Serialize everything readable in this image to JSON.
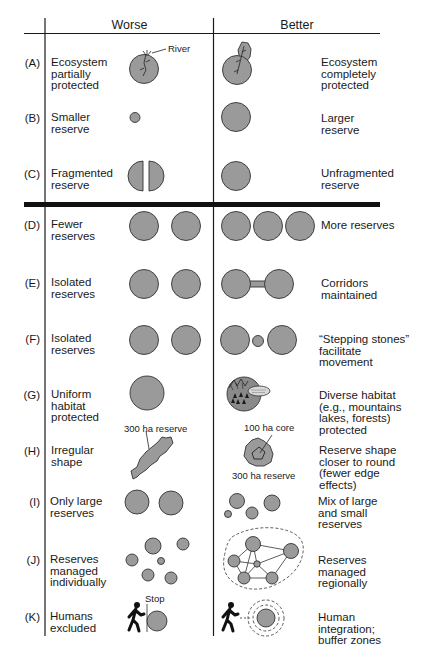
{
  "headers": {
    "worse": "Worse",
    "better": "Better"
  },
  "colors": {
    "reserve_fill": "#9a9a9a",
    "line": "#1a1a1a",
    "background": "#ffffff"
  },
  "rows": [
    {
      "id": "(A)",
      "worse": "Ecosystem\npartially\nprotected",
      "better": "Ecosystem\ncompletely\nprotected"
    },
    {
      "id": "(B)",
      "worse": "Smaller\nreserve",
      "better": "Larger\nreserve"
    },
    {
      "id": "(C)",
      "worse": "Fragmented\nreserve",
      "better": "Unfragmented\nreserve"
    },
    {
      "id": "(D)",
      "worse": "Fewer\nreserves",
      "better": "More reserves"
    },
    {
      "id": "(E)",
      "worse": "Isolated\nreserves",
      "better": "Corridors\nmaintained"
    },
    {
      "id": "(F)",
      "worse": "Isolated\nreserves",
      "better": "“Stepping stones”\nfacilitate\nmovement"
    },
    {
      "id": "(G)",
      "worse": "Uniform\nhabitat\nprotected",
      "better": "Diverse habitat\n(e.g., mountains\nlakes, forests)\nprotected"
    },
    {
      "id": "(H)",
      "worse": "Irregular\nshape",
      "better": "Reserve shape\ncloser to round\n(fewer edge\neffects)"
    },
    {
      "id": "(I)",
      "worse": "Only large\nreserves",
      "better": "Mix of large\nand small\nreserves"
    },
    {
      "id": "(J)",
      "worse": "Reserves\nmanaged\nindividually",
      "better": "Reserves\nmanaged\nregionally"
    },
    {
      "id": "(K)",
      "worse": "Humans\nexcluded",
      "better": "Human\nintegration;\nbuffer zones"
    }
  ],
  "annotations": {
    "river": "River",
    "irregular_reserve": "300 ha reserve",
    "core": "100 ha core",
    "round_reserve": "300 ha reserve",
    "stop": "Stop"
  },
  "icons": {
    "river": "river-icon",
    "reserve": "reserve-circle-icon",
    "habitat": "mountains-lakes-forests-icon",
    "hiker": "walking-person-icon",
    "buffer": "buffer-zone-icon"
  }
}
